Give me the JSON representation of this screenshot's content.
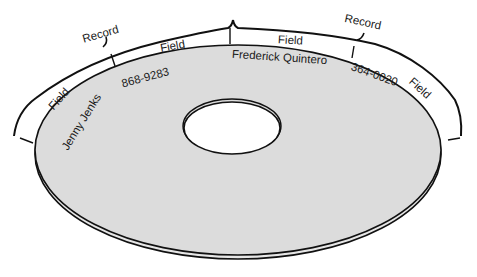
{
  "diagram": {
    "type": "disk-records-fields",
    "colors": {
      "disk_fill": "#dcdcdc",
      "stroke": "#111111",
      "hole_fill": "#ffffff",
      "background": "#ffffff"
    },
    "records": [
      {
        "label": "Record",
        "fields": [
          {
            "label": "Field",
            "value": "Jenny Jenks"
          },
          {
            "label": "Field",
            "value": "868-9283"
          }
        ]
      },
      {
        "label": "Record",
        "fields": [
          {
            "label": "Field",
            "value": "Frederick Quintero"
          },
          {
            "label": "Field",
            "value": "364-0020"
          }
        ]
      }
    ]
  }
}
